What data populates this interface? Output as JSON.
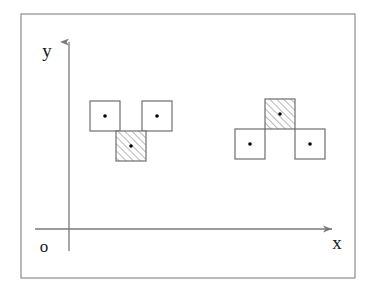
{
  "figure": {
    "background_color": "#ffffff",
    "frame": {
      "name": "outer-border",
      "x": 21,
      "y": 14,
      "width": 334,
      "height": 264,
      "stroke_color": "#8c8c8c",
      "stroke_width": 1.2
    },
    "axes": {
      "stroke_color": "#7a7a7a",
      "stroke_width": 1.3,
      "origin": {
        "x": 69,
        "y": 229
      },
      "x_axis": {
        "label": "x",
        "label_x": 337,
        "label_y": 249,
        "start_x": 35,
        "end_x": 332,
        "y": 229,
        "arrow": "right"
      },
      "y_axis": {
        "label": "y",
        "label_x": 47,
        "label_y": 57,
        "top_y": 42,
        "bottom_y": 251,
        "x": 69,
        "arrow": "up"
      },
      "origin_label": {
        "text": "o",
        "x": 44,
        "y": 252
      },
      "label_font_size": 19
    },
    "tiles": {
      "size": 30,
      "plain_fill": "#ffffff",
      "hatched_fill": "#ffffff",
      "stroke_color": "#6e6e6e",
      "stroke_width": 1.2,
      "hatch_color": "#6e6e6e",
      "hatch_angle_deg": 45,
      "center_dot_color": "#000000",
      "center_dot_radius": 1.8
    },
    "groups": [
      {
        "name": "left-triomino-group",
        "shape": "T-triomino",
        "squares": [
          {
            "name": "left-group-square-top-left",
            "x": 90,
            "y": 101,
            "hatched": false
          },
          {
            "name": "left-group-square-top-right",
            "x": 142,
            "y": 101,
            "hatched": false
          },
          {
            "name": "left-group-square-bottom-center",
            "x": 116,
            "y": 131,
            "hatched": true
          }
        ]
      },
      {
        "name": "right-triomino-group",
        "shape": "T-triomino",
        "squares": [
          {
            "name": "right-group-square-top-center",
            "x": 265,
            "y": 99,
            "hatched": true
          },
          {
            "name": "right-group-square-bottom-left",
            "x": 235,
            "y": 129,
            "hatched": false
          },
          {
            "name": "right-group-square-bottom-right",
            "x": 295,
            "y": 129,
            "hatched": false
          }
        ]
      }
    ]
  }
}
